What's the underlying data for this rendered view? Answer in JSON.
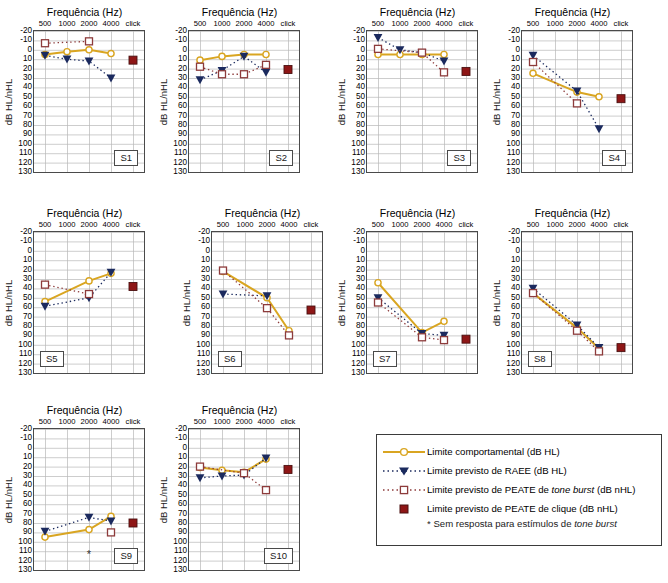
{
  "axis": {
    "xlabel": "Frequência (Hz)",
    "ylabel": "dB HL/nHL",
    "xticks": [
      "500",
      "1000",
      "2000",
      "4000",
      "click"
    ],
    "yticks": [
      "-20",
      "-10",
      "0",
      "10",
      "20",
      "30",
      "40",
      "50",
      "60",
      "70",
      "80",
      "90",
      "100",
      "110",
      "120",
      "130"
    ],
    "ylim": [
      -20,
      130
    ],
    "grid": true
  },
  "colors": {
    "behavioral": "#d9a521",
    "asse": "#1b2a5e",
    "toneburst": "#8d3b3b",
    "click": "#8e1616",
    "gridline": "#b8b8b8",
    "frame": "#4a4a4a"
  },
  "legend": {
    "position": "bottom-right",
    "items": [
      {
        "key": "line-circle-marker",
        "label": "Limite comportamental (dB HL)"
      },
      {
        "key": "dotted-triangle-marker",
        "label": "Limite previsto de RAEE (dB HL)"
      },
      {
        "key": "dotted-square-marker",
        "label": "Limite previsto de PEATE de tone burst (dB nHL)",
        "italic_part": "tone burst"
      },
      {
        "key": "filled-square-marker",
        "label": "Limite previsto de PEATE de clique (dB nHL)"
      }
    ],
    "note": "* Sem resposta para estímulos de tone burst",
    "note_italic_part": "tone burst"
  },
  "chart_data": {
    "type": "line",
    "title": "Frequência (Hz)",
    "xlabel": "Frequência (Hz)",
    "ylabel": "dB HL/nHL",
    "categories": [
      "500",
      "1000",
      "2000",
      "4000",
      "click"
    ],
    "ylim": [
      -20,
      130
    ],
    "y_inverted": true,
    "panels": [
      {
        "id": "S1",
        "series": [
          {
            "name": "Limite comportamental (dB HL)",
            "values": [
              5,
              2,
              0,
              4,
              null
            ]
          },
          {
            "name": "Limite previsto de RAEE (dB HL)",
            "values": [
              6,
              10,
              12,
              30,
              null
            ]
          },
          {
            "name": "Limite previsto de PEATE de tone burst (dB nHL)",
            "values": [
              -7,
              null,
              -9,
              null,
              null
            ]
          },
          {
            "name": "Limite previsto de PEATE de clique (dB nHL)",
            "values": [
              null,
              null,
              null,
              null,
              11
            ]
          }
        ],
        "no_response": []
      },
      {
        "id": "S2",
        "series": [
          {
            "name": "Limite comportamental (dB HL)",
            "values": [
              11,
              7,
              5,
              5,
              null
            ]
          },
          {
            "name": "Limite previsto de RAEE (dB HL)",
            "values": [
              32,
              22,
              7,
              24,
              null
            ]
          },
          {
            "name": "Limite previsto de PEATE de tone burst (dB nHL)",
            "values": [
              18,
              26,
              26,
              16,
              null
            ]
          },
          {
            "name": "Limite previsto de PEATE de clique (dB nHL)",
            "values": [
              null,
              null,
              null,
              null,
              21
            ]
          }
        ],
        "no_response": []
      },
      {
        "id": "S3",
        "series": [
          {
            "name": "Limite comportamental (dB HL)",
            "values": [
              5,
              5,
              5,
              5,
              null
            ]
          },
          {
            "name": "Limite previsto de RAEE (dB HL)",
            "values": [
              -13,
              0,
              3,
              12,
              null
            ]
          },
          {
            "name": "Limite previsto de PEATE de tone burst (dB nHL)",
            "values": [
              -1,
              null,
              3,
              24,
              null
            ]
          },
          {
            "name": "Limite previsto de PEATE de clique (dB nHL)",
            "values": [
              null,
              null,
              null,
              null,
              23
            ]
          }
        ],
        "no_response": []
      },
      {
        "id": "S4",
        "series": [
          {
            "name": "Limite comportamental (dB HL)",
            "values": [
              25,
              null,
              45,
              50,
              null
            ]
          },
          {
            "name": "Limite previsto de RAEE (dB HL)",
            "values": [
              6,
              null,
              44,
              84,
              null
            ]
          },
          {
            "name": "Limite previsto de PEATE de tone burst (dB nHL)",
            "values": [
              13,
              null,
              57,
              null,
              null
            ]
          },
          {
            "name": "Limite previsto de PEATE de clique (dB nHL)",
            "values": [
              null,
              null,
              null,
              null,
              52
            ]
          }
        ],
        "no_response": []
      },
      {
        "id": "S5",
        "series": [
          {
            "name": "Limite comportamental (dB HL)",
            "values": [
              54,
              null,
              32,
              24,
              null
            ]
          },
          {
            "name": "Limite previsto de RAEE (dB HL)",
            "values": [
              59,
              null,
              50,
              23,
              null
            ]
          },
          {
            "name": "Limite previsto de PEATE de tone burst (dB nHL)",
            "values": [
              36,
              null,
              46,
              null,
              null
            ]
          },
          {
            "name": "Limite previsto de PEATE de clique (dB nHL)",
            "values": [
              null,
              null,
              null,
              null,
              38
            ]
          }
        ],
        "no_response": []
      },
      {
        "id": "S6",
        "series": [
          {
            "name": "Limite comportamental (dB HL)",
            "values": [
              22,
              null,
              50,
              85,
              null
            ]
          },
          {
            "name": "Limite previsto de RAEE (dB HL)",
            "values": [
              46,
              null,
              48,
              null,
              null
            ]
          },
          {
            "name": "Limite previsto de PEATE de tone burst (dB nHL)",
            "values": [
              21,
              null,
              61,
              90,
              null
            ]
          },
          {
            "name": "Limite previsto de PEATE de clique (dB nHL)",
            "values": [
              null,
              null,
              null,
              null,
              63
            ]
          }
        ],
        "no_response": []
      },
      {
        "id": "S7",
        "series": [
          {
            "name": "Limite comportamental (dB HL)",
            "values": [
              34,
              null,
              87,
              75,
              null
            ]
          },
          {
            "name": "Limite previsto de RAEE (dB HL)",
            "values": [
              50,
              null,
              88,
              90,
              null
            ]
          },
          {
            "name": "Limite previsto de PEATE de tone burst (dB nHL)",
            "values": [
              55,
              null,
              92,
              95,
              null
            ]
          },
          {
            "name": "Limite previsto de PEATE de clique (dB nHL)",
            "values": [
              null,
              null,
              null,
              null,
              94
            ]
          }
        ],
        "no_response": []
      },
      {
        "id": "S8",
        "series": [
          {
            "name": "Limite comportamental (dB HL)",
            "values": [
              45,
              null,
              82,
              104,
              null
            ]
          },
          {
            "name": "Limite previsto de RAEE (dB HL)",
            "values": [
              40,
              null,
              79,
              103,
              null
            ]
          },
          {
            "name": "Limite previsto de PEATE de tone burst (dB nHL)",
            "values": [
              45,
              null,
              85,
              107,
              null
            ]
          },
          {
            "name": "Limite previsto de PEATE de clique (dB nHL)",
            "values": [
              null,
              null,
              null,
              null,
              103
            ]
          }
        ],
        "no_response": []
      },
      {
        "id": "S9",
        "series": [
          {
            "name": "Limite comportamental (dB HL)",
            "values": [
              95,
              null,
              87,
              73,
              null
            ]
          },
          {
            "name": "Limite previsto de RAEE (dB HL)",
            "values": [
              89,
              null,
              74,
              78,
              null
            ]
          },
          {
            "name": "Limite previsto de PEATE de tone burst (dB nHL)",
            "values": [
              null,
              null,
              null,
              90,
              null
            ]
          },
          {
            "name": "Limite previsto de PEATE de clique (dB nHL)",
            "values": [
              null,
              null,
              null,
              null,
              80
            ]
          }
        ],
        "no_response": [
          {
            "x": "2000",
            "y": 117
          }
        ]
      },
      {
        "id": "S10",
        "series": [
          {
            "name": "Limite comportamental (dB HL)",
            "values": [
              21,
              24,
              26,
              12,
              null
            ]
          },
          {
            "name": "Limite previsto de RAEE (dB HL)",
            "values": [
              32,
              30,
              29,
              11,
              null
            ]
          },
          {
            "name": "Limite previsto de PEATE de tone burst (dB nHL)",
            "values": [
              20,
              null,
              27,
              45,
              null
            ]
          },
          {
            "name": "Limite previsto de PEATE de clique (dB nHL)",
            "values": [
              null,
              null,
              null,
              null,
              23
            ]
          }
        ],
        "no_response": []
      }
    ]
  }
}
